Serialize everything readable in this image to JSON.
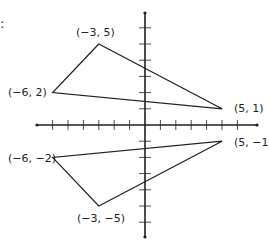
{
  "prefix_text": ":",
  "chart_data": {
    "type": "coordinate-plane",
    "title": "",
    "xlabel": "",
    "ylabel": "",
    "xlim": [
      -7,
      7
    ],
    "ylim": [
      -7,
      7
    ],
    "tick_step": 1,
    "grid": false,
    "tick_labels_shown": false,
    "shapes": [
      {
        "name": "upper-triangle",
        "vertices": [
          [
            -3,
            5
          ],
          [
            -6,
            2
          ],
          [
            5,
            1
          ]
        ],
        "labels": [
          "(−3, 5)",
          "(−6, 2)",
          "(5, 1)"
        ]
      },
      {
        "name": "lower-triangle",
        "vertices": [
          [
            -6,
            -2
          ],
          [
            -3,
            -5
          ],
          [
            5,
            -1
          ]
        ],
        "labels": [
          "(−6, −2)",
          "(−3, −5)",
          "(5, −1)"
        ]
      }
    ]
  },
  "style": {
    "line_color": "#231f20",
    "axis_color": "#231f20",
    "background": "#ffffff"
  },
  "layout": {
    "origin_px": [
      145,
      125
    ],
    "unit_x_px": 15.4,
    "unit_y_px": 16.2,
    "x_axis_px": [
      37,
      257
    ],
    "y_axis_px": [
      13,
      237
    ],
    "label_positions": {
      "upper-triangle": [
        [
          76,
          36
        ],
        [
          8,
          96
        ],
        [
          234,
          112
        ]
      ],
      "lower-triangle": [
        [
          8,
          162
        ],
        [
          77,
          222
        ],
        [
          234,
          146
        ]
      ]
    }
  }
}
